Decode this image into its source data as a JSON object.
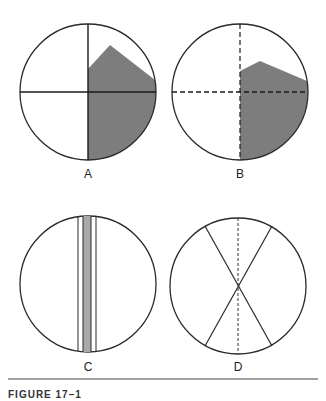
{
  "figure": {
    "caption": "FIGURE 17–1",
    "colors": {
      "stroke": "#2a2a2a",
      "shade": "#7d7d7d",
      "strip_shade": "#a9a9a9",
      "background": "#ffffff"
    },
    "panels": [
      {
        "id": "A",
        "label": "A",
        "description": "Circle divided by solid crosshairs; right half shaded with irregular upper boundary"
      },
      {
        "id": "B",
        "label": "B",
        "description": "Circle divided by dashed crosshairs; right half shaded with flatter upper boundary"
      },
      {
        "id": "C",
        "label": "C",
        "description": "Circle with narrow vertical strip of parallel lines, central band shaded"
      },
      {
        "id": "D",
        "label": "D",
        "description": "Circle with two crossing diagonal lines forming an X and a dashed vertical line"
      }
    ]
  }
}
